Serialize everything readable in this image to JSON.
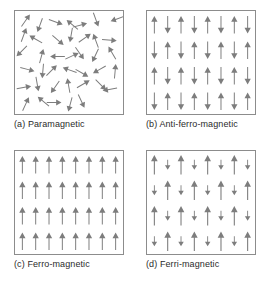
{
  "figure": {
    "background_color": "#ffffff",
    "arrow_color": "#7d7d7d",
    "border_color": "#8c8c8c",
    "caption_color": "#2b2b2b"
  },
  "panels": [
    {
      "id": "a",
      "caption": "(a) Paramagnetic",
      "ordering": "random",
      "columns": 0,
      "rows": 0,
      "arrow_count": 40,
      "angles_deg": [
        35,
        200,
        110,
        310,
        75,
        160,
        250,
        20,
        300,
        130,
        190,
        55,
        340,
        95,
        225,
        15,
        270,
        65,
        145,
        205,
        330,
        105,
        185,
        45,
        290,
        120,
        240,
        5,
        80,
        170,
        215,
        350,
        60,
        135,
        260,
        25,
        310,
        90,
        195,
        155
      ]
    },
    {
      "id": "b",
      "caption": "(b) Anti-ferro-magnetic",
      "ordering": "checkerboard-alternating",
      "columns": 8,
      "rows": 4,
      "arrow_count": 32,
      "pattern": [
        [
          "up",
          "down",
          "up",
          "down",
          "up",
          "down",
          "up",
          "down"
        ],
        [
          "down",
          "up",
          "down",
          "up",
          "down",
          "up",
          "down",
          "up"
        ],
        [
          "up",
          "down",
          "up",
          "down",
          "up",
          "down",
          "up",
          "down"
        ],
        [
          "down",
          "up",
          "down",
          "up",
          "down",
          "up",
          "down",
          "up"
        ]
      ]
    },
    {
      "id": "c",
      "caption": "(c) Ferro-magnetic",
      "ordering": "aligned-parallel",
      "columns": 8,
      "rows": 4,
      "arrow_count": 32,
      "pattern": [
        [
          "up",
          "up",
          "up",
          "up",
          "up",
          "up",
          "up",
          "up"
        ],
        [
          "up",
          "up",
          "up",
          "up",
          "up",
          "up",
          "up",
          "up"
        ],
        [
          "up",
          "up",
          "up",
          "up",
          "up",
          "up",
          "up",
          "up"
        ],
        [
          "up",
          "up",
          "up",
          "up",
          "up",
          "up",
          "up",
          "up"
        ]
      ]
    },
    {
      "id": "d",
      "caption": "(d) Ferri-magnetic",
      "ordering": "alternating-unequal-moments",
      "columns": 8,
      "rows": 4,
      "arrow_count": 32,
      "pattern": [
        [
          "up-long",
          "down-short",
          "up-long",
          "down-short",
          "up-long",
          "down-short",
          "up-long",
          "down-short"
        ],
        [
          "down-short",
          "up-long",
          "down-short",
          "up-long",
          "down-short",
          "up-long",
          "down-short",
          "up-long"
        ],
        [
          "up-long",
          "down-short",
          "up-long",
          "down-short",
          "up-long",
          "down-short",
          "up-long",
          "down-short"
        ],
        [
          "down-short",
          "up-long",
          "down-short",
          "up-long",
          "down-short",
          "up-long",
          "down-short",
          "up-long"
        ]
      ]
    }
  ]
}
